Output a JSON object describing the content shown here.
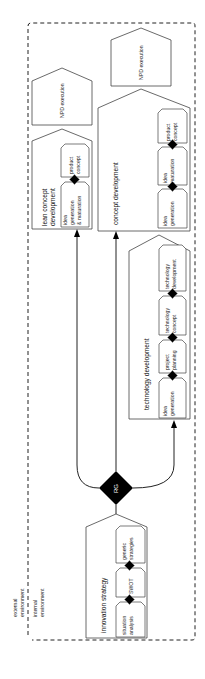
{
  "diagram": {
    "orientation": "rotated-90-ccw",
    "environment": {
      "external_label_1": "external",
      "external_label_2": "environment",
      "internal_label_1": "internal",
      "internal_label_2": "environment"
    },
    "gate": {
      "label": "RG",
      "color": "#000000"
    },
    "innovation_strategy": {
      "title": "innovation strategy",
      "steps": [
        {
          "line1": "situation",
          "line2": "analysis"
        },
        {
          "line1": "SWOT",
          "line2": ""
        },
        {
          "line1": "generic",
          "line2": "strategies"
        }
      ]
    },
    "lean_concept": {
      "title_line1": "lean concept",
      "title_line2": "development",
      "steps": [
        {
          "line1": "idea",
          "line2": "generation",
          "line3": "& maturation"
        },
        {
          "line1": "product",
          "line2": "concept"
        }
      ]
    },
    "concept_development": {
      "title": "concept development",
      "steps": [
        {
          "line1": "idea",
          "line2": "generation"
        },
        {
          "line1": "idea",
          "line2": "maturation"
        },
        {
          "line1": "product",
          "line2": "concept"
        }
      ]
    },
    "technology_development": {
      "title": "technology development",
      "steps": [
        {
          "line1": "idea",
          "line2": "generation"
        },
        {
          "line1": "project",
          "line2": "planning"
        },
        {
          "line1": "technology",
          "line2": "concept"
        },
        {
          "line1": "technology",
          "line2": "development"
        }
      ]
    },
    "npd_execution_left": {
      "label": "NPD execution"
    },
    "npd_execution_right": {
      "label": "NPD execution"
    }
  }
}
